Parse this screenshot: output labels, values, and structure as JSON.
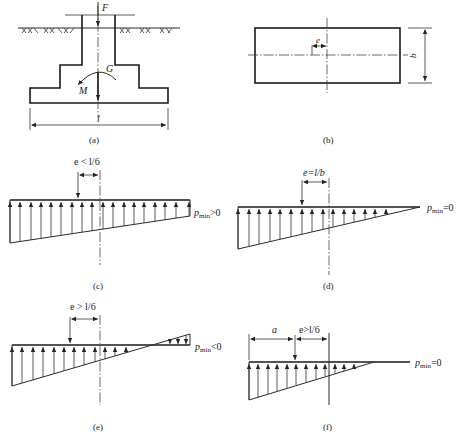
{
  "figure": {
    "panels": [
      {
        "id": "a",
        "caption": "(a)",
        "labels": {
          "force": "F",
          "weight": "G",
          "moment": "M",
          "length": "l"
        }
      },
      {
        "id": "b",
        "caption": "(b)",
        "labels": {
          "eccentricity": "e",
          "width": "b"
        }
      },
      {
        "id": "c",
        "caption": "(c)",
        "condition": "e < l/6",
        "pmin_label": "p",
        "pmin_sub": "min",
        "pmin_rel": ">0"
      },
      {
        "id": "d",
        "caption": "(d)",
        "condition": "e=l/b",
        "pmin_label": "p",
        "pmin_sub": "min",
        "pmin_rel": "=0"
      },
      {
        "id": "e",
        "caption": "(e)",
        "condition": "e > l/6",
        "pmin_label": "p",
        "pmin_sub": "min",
        "pmin_rel": "<0"
      },
      {
        "id": "f",
        "caption": "(f)",
        "condition": "e>l/6",
        "dim_a": "a",
        "pmin_label": "p",
        "pmin_sub": "min",
        "pmin_rel": "=0"
      }
    ]
  }
}
